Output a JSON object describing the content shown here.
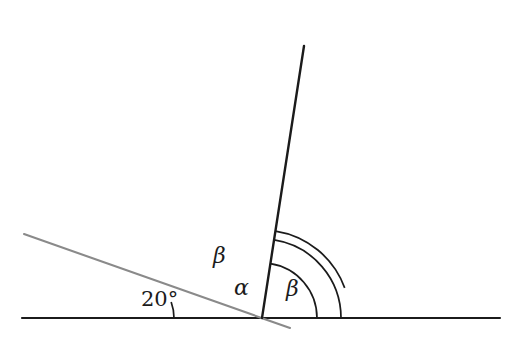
{
  "figure": {
    "kind": "plane-geometry-angle-diagram",
    "width": 519,
    "height": 345,
    "background_color": "#ffffff"
  },
  "colors": {
    "baseline_stroke": "#1b1b1b",
    "ray_steep_stroke": "#1b1b1b",
    "ray_transversal_stroke": "#8a8a8a",
    "arc_stroke": "#1b1b1b",
    "label_color": "#1b1b1b"
  },
  "geometry": {
    "vertex_main": {
      "x": 262,
      "y": 318
    },
    "vertex_twenty": {
      "x": 127,
      "y": 318
    },
    "baseline": {
      "x1": 22,
      "y1": 318,
      "x2": 500,
      "y2": 318
    },
    "ray_steep": {
      "x1": 262,
      "y1": 318,
      "x2": 304,
      "y2": 46,
      "angle_deg": 81.2
    },
    "ray_transversal": {
      "x1": 24,
      "y1": 234,
      "x2": 290,
      "y2": 328,
      "angle_deg": 20
    },
    "arc_twenty": {
      "cx": 127,
      "cy": 318,
      "r": 47,
      "start_deg": 0,
      "end_deg": 20
    },
    "arc_alpha": {
      "cx": 262,
      "cy": 318,
      "r": 55,
      "start_deg": 0,
      "end_deg": 81.2
    },
    "arc_beta_left": {
      "cx": 262,
      "cy": 318,
      "r": 88,
      "start_deg": 20,
      "end_deg": 81.2
    },
    "arc_beta_right": {
      "cx": 262,
      "cy": 318,
      "r": 79,
      "start_deg": 0,
      "end_deg": 81.2
    }
  },
  "labels": {
    "angle_twenty": {
      "text": "20°",
      "x": 141,
      "y": 289
    },
    "angle_beta_upper": {
      "text": "β",
      "x": 213,
      "y": 245
    },
    "angle_alpha": {
      "text": "α",
      "x": 234,
      "y": 277
    },
    "angle_beta_right": {
      "text": "β",
      "x": 286,
      "y": 278
    }
  }
}
